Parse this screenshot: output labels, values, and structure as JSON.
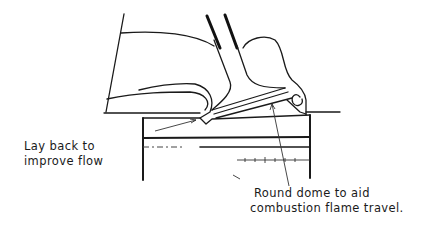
{
  "diagram": {
    "annotations": [
      {
        "id": "lay-back",
        "lines": [
          "Lay back to",
          "improve flow"
        ]
      },
      {
        "id": "round-dome",
        "lines": [
          "Round dome to aid",
          "combustion flame travel."
        ]
      }
    ],
    "colors": {
      "ink": "#1a1a1a",
      "background": "#ffffff"
    }
  }
}
